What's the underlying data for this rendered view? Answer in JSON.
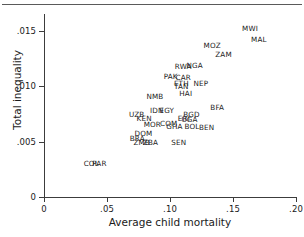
{
  "chart_data": {
    "type": "scatter",
    "title": "",
    "xlabel": "Average child mortality",
    "ylabel": "Total inequality",
    "xlim": [
      0,
      0.2
    ],
    "ylim": [
      0,
      0.0165
    ],
    "grid": false,
    "legend": "none",
    "xticks": [
      "0",
      ".05",
      ".10",
      ".15",
      ".20"
    ],
    "xtick_values": [
      0,
      0.05,
      0.1,
      0.15,
      0.2
    ],
    "yticks": [
      "0",
      ".005",
      ".010",
      ".015"
    ],
    "ytick_values": [
      0,
      0.005,
      0.01,
      0.015
    ],
    "point_label_style": "country-code-text-marker",
    "points": [
      {
        "label": "MWI",
        "x": 0.1635,
        "y": 0.01515
      },
      {
        "label": "MAL",
        "x": 0.1705,
        "y": 0.01415
      },
      {
        "label": "MOZ",
        "x": 0.1335,
        "y": 0.0136
      },
      {
        "label": "ZAM",
        "x": 0.1425,
        "y": 0.0128
      },
      {
        "label": "NGA",
        "x": 0.1195,
        "y": 0.01185
      },
      {
        "label": "RWA",
        "x": 0.1105,
        "y": 0.0117
      },
      {
        "label": "PAK",
        "x": 0.1005,
        "y": 0.0108
      },
      {
        "label": "CAR",
        "x": 0.1105,
        "y": 0.0107
      },
      {
        "label": "ETH",
        "x": 0.109,
        "y": 0.0102
      },
      {
        "label": "TAN",
        "x": 0.109,
        "y": 0.00995
      },
      {
        "label": "NEP",
        "x": 0.1245,
        "y": 0.01015
      },
      {
        "label": "HAI",
        "x": 0.1125,
        "y": 0.00925
      },
      {
        "label": "NMB",
        "x": 0.088,
        "y": 0.00905
      },
      {
        "label": "BFA",
        "x": 0.1375,
        "y": 0.00805
      },
      {
        "label": "IDN",
        "x": 0.0895,
        "y": 0.00775
      },
      {
        "label": "EGY",
        "x": 0.0975,
        "y": 0.00775
      },
      {
        "label": "UZB",
        "x": 0.0735,
        "y": 0.0074
      },
      {
        "label": "BGD",
        "x": 0.117,
        "y": 0.0074
      },
      {
        "label": "KEN",
        "x": 0.0795,
        "y": 0.00705
      },
      {
        "label": "ERI",
        "x": 0.111,
        "y": 0.007
      },
      {
        "label": "UGA",
        "x": 0.1155,
        "y": 0.0069
      },
      {
        "label": "COM",
        "x": 0.099,
        "y": 0.00655
      },
      {
        "label": "MOR",
        "x": 0.086,
        "y": 0.00645
      },
      {
        "label": "GHA",
        "x": 0.1035,
        "y": 0.00635
      },
      {
        "label": "BOL",
        "x": 0.1175,
        "y": 0.00635
      },
      {
        "label": "BEN",
        "x": 0.129,
        "y": 0.00625
      },
      {
        "label": "DOM",
        "x": 0.079,
        "y": 0.00565
      },
      {
        "label": "BRA",
        "x": 0.074,
        "y": 0.00525
      },
      {
        "label": "ZMB",
        "x": 0.0775,
        "y": 0.0049
      },
      {
        "label": "ZBA",
        "x": 0.0845,
        "y": 0.0049
      },
      {
        "label": "SEN",
        "x": 0.107,
        "y": 0.00485
      },
      {
        "label": "COL",
        "x": 0.0375,
        "y": 0.003
      },
      {
        "label": "PAR",
        "x": 0.044,
        "y": 0.00295
      }
    ]
  }
}
